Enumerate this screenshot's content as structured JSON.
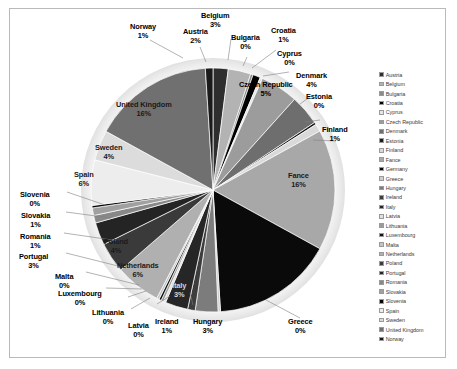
{
  "chart_data": {
    "type": "pie",
    "title": "",
    "subtitle": "",
    "legend_position": "right",
    "labels_show_percent": true,
    "categories": [
      "Austria",
      "Belgium",
      "Bulgaria",
      "Croatia",
      "Cyprus",
      "Czech Republic",
      "Denmark",
      "Estonia",
      "Finland",
      "Fance",
      "Germany",
      "Greece",
      "Hungary",
      "Ireland",
      "Italy",
      "Latvia",
      "Lithuania",
      "Luxembourg",
      "Malta",
      "Netherlands",
      "Poland",
      "Portugal",
      "Romania",
      "Slovakia",
      "Slovenia",
      "Spain",
      "Sweden",
      "United Kingdom",
      "Norway"
    ],
    "values": [
      2,
      3,
      0,
      1,
      0,
      5,
      4,
      0,
      1,
      16,
      16,
      0,
      3,
      1,
      3,
      0,
      0,
      0,
      0,
      6,
      4,
      3,
      1,
      1,
      0,
      6,
      4,
      16,
      1
    ],
    "percent_labels": [
      "2%",
      "3%",
      "0%",
      "1%",
      "0%",
      "5%",
      "4%",
      "0%",
      "1%",
      "16%",
      "16%",
      "0%",
      "3%",
      "1%",
      "3%",
      "0%",
      "0%",
      "0%",
      "0%",
      "6%",
      "4%",
      "3%",
      "1%",
      "1%",
      "0%",
      "6%",
      "4%",
      "16%",
      "1%"
    ],
    "slice_colors": [
      "#2e2e2e",
      "#b3b3b3",
      "#8a8a8a",
      "#000000",
      "#e6e6e6",
      "#9c9c9c",
      "#6e6e6e",
      "#1c1c1c",
      "#d9d9d9",
      "#a8a8a8",
      "#0a0a0a",
      "#cfcfcf",
      "#7c7c7c",
      "#3d3d3d",
      "#262626",
      "#e0e0e0",
      "#9a9a9a",
      "#141414",
      "#c4c4c4",
      "#b0b0b0",
      "#3a3a3a",
      "#242424",
      "#888888",
      "#a0a0a0",
      "#050505",
      "#ededed",
      "#dcdcdc",
      "#707070",
      "#1a1a1a"
    ]
  },
  "legend": {
    "items": [
      {
        "label": "Austria",
        "color": "#2e2e2e"
      },
      {
        "label": "Belgium",
        "color": "#b3b3b3"
      },
      {
        "label": "Bulgaria",
        "color": "#8a8a8a"
      },
      {
        "label": "Croatia",
        "color": "#000000"
      },
      {
        "label": "Cyprus",
        "color": "#e6e6e6"
      },
      {
        "label": "Czech Republic",
        "color": "#9c9c9c"
      },
      {
        "label": "Denmark",
        "color": "#6e6e6e"
      },
      {
        "label": "Estonia",
        "color": "#1c1c1c"
      },
      {
        "label": "Finland",
        "color": "#d9d9d9"
      },
      {
        "label": "Fance",
        "color": "#a8a8a8"
      },
      {
        "label": "Germany",
        "color": "#0a0a0a"
      },
      {
        "label": "Greece",
        "color": "#cfcfcf"
      },
      {
        "label": "Hungary",
        "color": "#7c7c7c"
      },
      {
        "label": "Ireland",
        "color": "#3d3d3d"
      },
      {
        "label": "Italy",
        "color": "#262626"
      },
      {
        "label": "Latvia",
        "color": "#e0e0e0"
      },
      {
        "label": "Lithuania",
        "color": "#9a9a9a"
      },
      {
        "label": "Luxembourg",
        "color": "#141414"
      },
      {
        "label": "Malta",
        "color": "#c4c4c4"
      },
      {
        "label": "Netherlands",
        "color": "#b0b0b0"
      },
      {
        "label": "Poland",
        "color": "#3a3a3a"
      },
      {
        "label": "Portugal",
        "color": "#242424"
      },
      {
        "label": "Romania",
        "color": "#888888"
      },
      {
        "label": "Slovakia",
        "color": "#a0a0a0"
      },
      {
        "label": "Slovenia",
        "color": "#050505"
      },
      {
        "label": "Spain",
        "color": "#ededed"
      },
      {
        "label": "Sweden",
        "color": "#dcdcdc"
      },
      {
        "label": "United Kingdom",
        "color": "#707070"
      },
      {
        "label": "Norway",
        "color": "#1a1a1a"
      }
    ]
  },
  "callouts": [
    {
      "name": "belgium",
      "label": "Belgium",
      "pct": "3%"
    },
    {
      "name": "norway",
      "label": "Norway",
      "pct": "1%"
    },
    {
      "name": "austria",
      "label": "Austria",
      "pct": "2%"
    },
    {
      "name": "bulgaria",
      "label": "Bulgaria",
      "pct": "0%"
    },
    {
      "name": "croatia",
      "label": "Croatia",
      "pct": "1%"
    },
    {
      "name": "cyprus",
      "label": "Cyprus",
      "pct": "0%"
    },
    {
      "name": "czech-republic",
      "label": "Czech Republic",
      "pct": "5%"
    },
    {
      "name": "denmark",
      "label": "Denmark",
      "pct": "4%"
    },
    {
      "name": "estonia",
      "label": "Estonia",
      "pct": "0%"
    },
    {
      "name": "finland",
      "label": "Finland",
      "pct": "1%"
    },
    {
      "name": "fance",
      "label": "Fance",
      "pct": "16%"
    },
    {
      "name": "greece",
      "label": "Greece",
      "pct": "0%"
    },
    {
      "name": "hungary",
      "label": "Hungary",
      "pct": "3%"
    },
    {
      "name": "ireland",
      "label": "Ireland",
      "pct": "1%"
    },
    {
      "name": "latvia",
      "label": "Latvia",
      "pct": "0%"
    },
    {
      "name": "lithuania",
      "label": "Lithuania",
      "pct": "0%"
    },
    {
      "name": "luxembourg",
      "label": "Luxembourg",
      "pct": "0%"
    },
    {
      "name": "malta",
      "label": "Malta",
      "pct": "0%"
    },
    {
      "name": "portugal",
      "label": "Portugal",
      "pct": "3%"
    },
    {
      "name": "romania",
      "label": "Romania",
      "pct": "1%"
    },
    {
      "name": "slovakia",
      "label": "Slovakia",
      "pct": "1%"
    },
    {
      "name": "slovenia",
      "label": "Slovenia",
      "pct": "0%"
    },
    {
      "name": "italy",
      "label": "Italy",
      "pct": "3%"
    },
    {
      "name": "netherlands",
      "label": "Netherlands",
      "pct": "6%"
    },
    {
      "name": "poland",
      "label": "Poland",
      "pct": "4%"
    },
    {
      "name": "spain",
      "label": "Spain",
      "pct": "6%"
    },
    {
      "name": "sweden",
      "label": "Sweden",
      "pct": "4%"
    },
    {
      "name": "united-kingdom",
      "label": "United Kingdom",
      "pct": "16%"
    }
  ]
}
